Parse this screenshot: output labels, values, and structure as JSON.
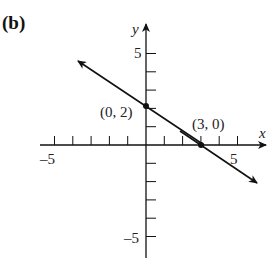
{
  "panel_label": "(b)",
  "chart_data": {
    "type": "line",
    "title": "",
    "xlabel": "x",
    "ylabel": "y",
    "xlim": [
      -5,
      5
    ],
    "ylim": [
      -5,
      5
    ],
    "grid": false,
    "tick_labels": {
      "x": [
        "-5",
        "5"
      ],
      "y": [
        "5",
        "-5"
      ]
    },
    "series": [
      {
        "name": "line",
        "equation": "y = -2/3 x + 2",
        "points": [
          [
            0,
            2
          ],
          [
            3,
            0
          ]
        ]
      }
    ],
    "annotations": [
      {
        "text": "(0, 2)",
        "x": 0,
        "y": 2
      },
      {
        "text": "(3, 0)",
        "x": 3,
        "y": 0
      }
    ]
  },
  "colors": {
    "ink": "#111111",
    "background": "#ffffff"
  }
}
